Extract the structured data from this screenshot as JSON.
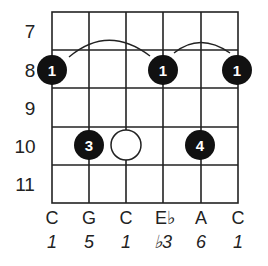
{
  "diagram": {
    "type": "guitar-chord-diagram",
    "colors": {
      "line": "#222222",
      "dot": "#111111",
      "dot_text": "#ffffff",
      "open_dot": "#ffffff"
    },
    "fret_labels": [
      "7",
      "8",
      "9",
      "10",
      "11"
    ],
    "strings": [
      {
        "note": "C",
        "interval": "1"
      },
      {
        "note": "G",
        "interval": "5"
      },
      {
        "note": "C",
        "interval": "1"
      },
      {
        "note": "E♭",
        "interval": "♭3"
      },
      {
        "note": "A",
        "interval": "6"
      },
      {
        "note": "C",
        "interval": "1"
      }
    ],
    "dots": [
      {
        "string": 1,
        "fret": 8,
        "finger": "1",
        "filled": true
      },
      {
        "string": 4,
        "fret": 8,
        "finger": "1",
        "filled": true
      },
      {
        "string": 6,
        "fret": 8,
        "finger": "1",
        "filled": true
      },
      {
        "string": 2,
        "fret": 10,
        "finger": "3",
        "filled": true
      },
      {
        "string": 3,
        "fret": 10,
        "finger": "",
        "filled": false
      },
      {
        "string": 5,
        "fret": 10,
        "finger": "4",
        "filled": true
      }
    ],
    "barres": [
      {
        "from_string": 1,
        "to_string": 4,
        "fret": 8
      },
      {
        "from_string": 4,
        "to_string": 6,
        "fret": 8
      }
    ]
  }
}
